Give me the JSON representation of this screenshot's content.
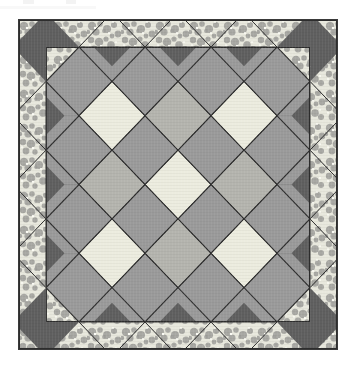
{
  "document": {
    "type": "quilt-pattern-illustration",
    "background_color": "#ffffff",
    "caption": ""
  },
  "quilt": {
    "name": "Snowball and Square-on-Point Quilt",
    "frame": {
      "x": 18,
      "y": 19,
      "width": 320,
      "height": 331,
      "border_color": "#3a3a3a",
      "border_width": 1
    },
    "layout": {
      "grid_columns": 4,
      "grid_rows": 4,
      "diamond_columns": 3,
      "diamond_rows": 3,
      "cell_width": 66.5,
      "cell_height": 68.5,
      "border_band": 27,
      "octagon_corner_cut": 0.28
    },
    "colors": {
      "background_setting": "#d8d8d2",
      "octagon": "#9a9a9a",
      "corner_triangle_dark": "#5f5f5f",
      "diamond_light": "#ececdf",
      "diamond_medium": "#b4b4ae",
      "seam_line": "#2d2d2d",
      "border_print_base": "#e8e8dd",
      "border_print_motif": "#9d9d99",
      "border_print_highlight": "#fdfdf6"
    },
    "pieces": {
      "octagon_label": "snowball-block",
      "diamond_label": "square-on-point",
      "triangle_label": "corner-triangle",
      "border_label": "floral-print-border"
    },
    "diamond_fill_grid": [
      [
        "light",
        "medium",
        "light"
      ],
      [
        "medium",
        "light",
        "medium"
      ],
      [
        "light",
        "medium",
        "light"
      ]
    ],
    "edge_half_diamond_fill": "border_print"
  },
  "artifacts": [
    {
      "x": 23,
      "y": 0,
      "width": 11,
      "height": 4
    },
    {
      "x": 66,
      "y": 0,
      "width": 10,
      "height": 4
    },
    {
      "x": 0,
      "y": 6,
      "width": 96,
      "height": 3
    }
  ]
}
